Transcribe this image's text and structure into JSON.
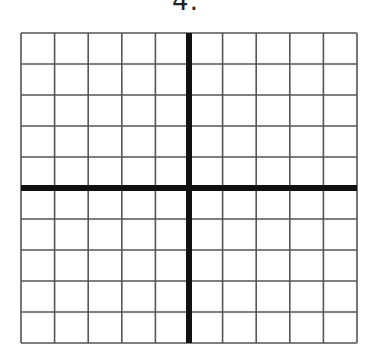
{
  "problem": {
    "number_label": "4."
  },
  "grid": {
    "columns": 10,
    "rows": 10,
    "left": 21,
    "top": 33,
    "right": 357,
    "bottom": 343,
    "axis_x_col": 5,
    "axis_y_row": 5,
    "grid_color": "#555555",
    "axis_color": "#111111",
    "grid_line_width": 1.6,
    "axis_line_width": 6
  }
}
